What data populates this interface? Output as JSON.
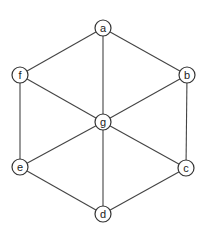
{
  "diagram": {
    "type": "graph",
    "nodes": [
      {
        "id": "a",
        "label": "a",
        "x": 103,
        "y": 28
      },
      {
        "id": "b",
        "label": "b",
        "x": 187,
        "y": 75
      },
      {
        "id": "c",
        "label": "c",
        "x": 186,
        "y": 168
      },
      {
        "id": "d",
        "label": "d",
        "x": 103,
        "y": 214
      },
      {
        "id": "e",
        "label": "e",
        "x": 20,
        "y": 167
      },
      {
        "id": "f",
        "label": "f",
        "x": 20,
        "y": 75
      },
      {
        "id": "g",
        "label": "g",
        "x": 103,
        "y": 122
      }
    ],
    "edges": [
      [
        "a",
        "b"
      ],
      [
        "b",
        "c"
      ],
      [
        "c",
        "d"
      ],
      [
        "d",
        "e"
      ],
      [
        "e",
        "f"
      ],
      [
        "f",
        "a"
      ],
      [
        "a",
        "g"
      ],
      [
        "b",
        "g"
      ],
      [
        "c",
        "g"
      ],
      [
        "d",
        "g"
      ],
      [
        "e",
        "g"
      ],
      [
        "f",
        "g"
      ]
    ]
  }
}
